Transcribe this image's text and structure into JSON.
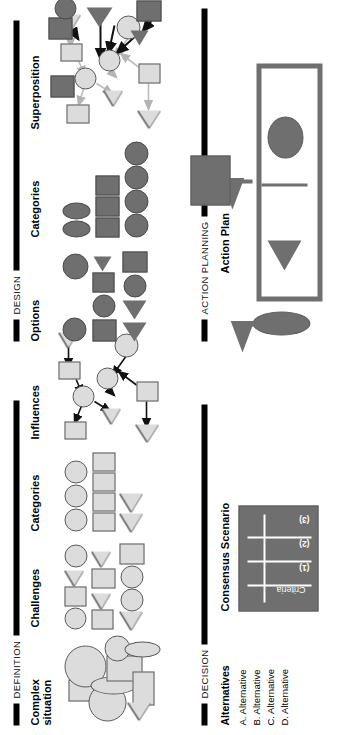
{
  "poster": {
    "orientation": "rotated-90-ccw",
    "background": "#ffffff",
    "palette": {
      "light_shape": "#dcdcdc",
      "dark_shape": "#6f6f6f",
      "outline": "#5a5a5a",
      "rule": "#000000",
      "table_fill": "#6f6f6f",
      "table_line": "#ffffff"
    }
  },
  "sections": {
    "definition": {
      "label": "DEFINITION",
      "panels": {
        "complex_situation": {
          "title": "Complex\nsituation",
          "description": "overlapping cluster of light grey circles, squares, ellipses and triangles"
        },
        "challenges": {
          "title": "Challenges",
          "rows": [
            [
              "circle",
              "square",
              "triangle",
              "circle"
            ],
            [
              "square",
              "triangle",
              "square",
              "triangle"
            ],
            [
              "triangle",
              "circle",
              "circle",
              "square"
            ]
          ]
        },
        "categories": {
          "title": "Categories",
          "groups": [
            {
              "shape": "circle",
              "count": 3
            },
            {
              "shape": "square",
              "count": 4
            },
            {
              "shape": "triangle",
              "count": 2
            }
          ]
        },
        "influences": {
          "title": "Influences",
          "description": "light grey nodes connected by black directed arrows",
          "node_count": 8,
          "arrow_count": 8
        }
      }
    },
    "design": {
      "label": "DESIGN",
      "panels": {
        "options": {
          "title": "Options",
          "rows": [
            [
              "circle",
              "",
              "",
              "circle"
            ],
            [
              "square",
              "circle",
              "square",
              "triangle"
            ],
            [
              "triangle",
              "triangle",
              "circle",
              "square"
            ]
          ]
        },
        "categories": {
          "title": "Categories",
          "groups": [
            {
              "shape": "ellipse",
              "count": 2
            },
            {
              "shape": "square",
              "count": 3
            },
            {
              "shape": "circle",
              "count": 4
            }
          ]
        },
        "superposition": {
          "title": "Superposition",
          "description": "light grey influences network overlaid with a dark grey option network",
          "light_node_count": 8,
          "dark_node_count": 6
        }
      }
    },
    "decision": {
      "label": "DECISION",
      "panels": {
        "alternatives": {
          "title": "Alternatives",
          "items": [
            "A. Alternative",
            "B. Alternative",
            "C. Alternative",
            "D. Alternative"
          ]
        },
        "consensus_scenario": {
          "title": "Consensus Scenario",
          "column_header": "Criteria",
          "rows": [
            "(1)",
            "(2)",
            "(3)"
          ]
        }
      }
    },
    "action_planning": {
      "label": "ACTION PLANNING",
      "panels": {
        "action_plan": {
          "title": "Action Plan",
          "input": "ellipse",
          "contents": [
            "triangle",
            "circle"
          ],
          "output": "square"
        }
      }
    }
  }
}
